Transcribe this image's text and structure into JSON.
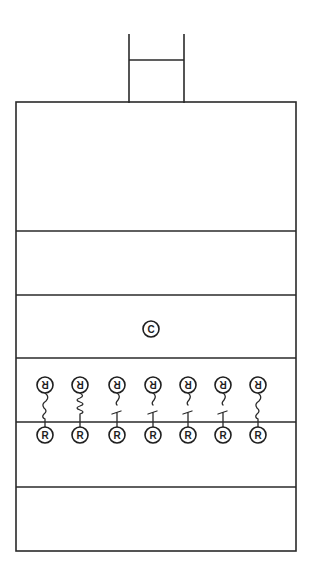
{
  "diagram": {
    "title": "",
    "colors": {
      "line": "#2a2a2a",
      "background": "#ffffff"
    },
    "ladder": {
      "left_x": 129,
      "right_x": 184,
      "top_y": 34,
      "rung_y": 60,
      "bottom_y": 103
    },
    "box": {
      "left": 16,
      "right": 296,
      "top": 102,
      "bottom": 551
    },
    "layer_dividers_y": [
      231,
      295,
      358,
      422,
      487
    ],
    "center_node": {
      "label": "C",
      "x": 151,
      "y": 329,
      "r": 8
    },
    "pairs": [
      {
        "x": 45,
        "top_label": "R",
        "bottom_label": "R",
        "connector": "squiggle"
      },
      {
        "x": 80,
        "top_label": "R",
        "bottom_label": "R",
        "connector": "coil"
      },
      {
        "x": 117,
        "top_label": "R",
        "bottom_label": "R",
        "connector": "hook-tee"
      },
      {
        "x": 153,
        "top_label": "R",
        "bottom_label": "R",
        "connector": "hook-tee"
      },
      {
        "x": 188,
        "top_label": "R",
        "bottom_label": "R",
        "connector": "hook-tee"
      },
      {
        "x": 223,
        "top_label": "R",
        "bottom_label": "R",
        "connector": "hook-tee"
      },
      {
        "x": 258,
        "top_label": "R",
        "bottom_label": "R",
        "connector": "squiggle"
      }
    ],
    "pair_rows": {
      "top_y": 385,
      "bottom_y": 435,
      "r": 8
    }
  }
}
